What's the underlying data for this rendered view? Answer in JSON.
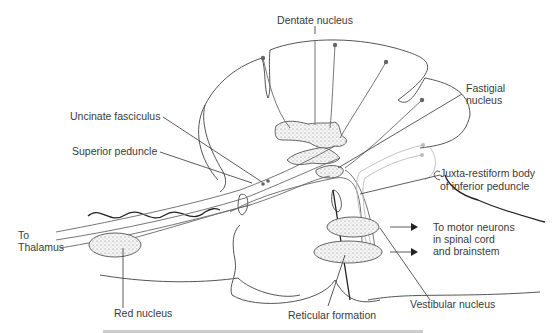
{
  "figure": {
    "type": "anatomical-diagram",
    "labels": {
      "dentate": "Dentate nucleus",
      "fastigial_1": "Fastigial",
      "fastigial_2": "nucleus",
      "uncinate": "Uncinate fasciculus",
      "superior_peduncle": "Superior peduncle",
      "juxta_1": "Juxta-restiform body",
      "juxta_2": "of inferior peduncle",
      "to_thalamus_1": "To",
      "to_thalamus_2": "Thalamus",
      "motor_1": "To motor neurons",
      "motor_2": "in spinal cord",
      "motor_3": "and brainstem",
      "red_nucleus": "Red nucleus",
      "reticular": "Reticular formation",
      "vestibular": "Vestibular nucleus"
    },
    "caption_visible": false,
    "note": "Caption text below the figure is cropped and illegible"
  }
}
